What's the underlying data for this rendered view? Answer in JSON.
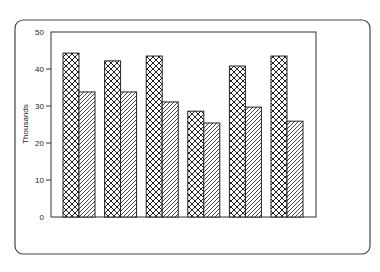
{
  "chart_data": {
    "type": "bar",
    "title": "",
    "xlabel": "",
    "ylabel": "Thousands",
    "ylim": [
      0,
      50
    ],
    "yticks": [
      0,
      10,
      20,
      30,
      40,
      50
    ],
    "grid": false,
    "legend": null,
    "categories": [
      "1",
      "2",
      "3",
      "4",
      "5",
      "6"
    ],
    "category_labels_visible": false,
    "series": [
      {
        "name": "Series A (crosshatch)",
        "pattern": "crosshatch",
        "values": [
          44.3,
          42.2,
          43.5,
          28.6,
          40.8,
          43.5
        ]
      },
      {
        "name": "Series B (diagonal stripes)",
        "pattern": "diagonal",
        "values": [
          33.8,
          33.8,
          31.1,
          25.4,
          29.7,
          25.9
        ]
      }
    ]
  },
  "colors": {
    "stroke": "#333333",
    "background": "#ffffff"
  }
}
